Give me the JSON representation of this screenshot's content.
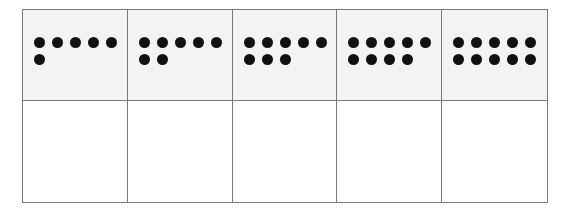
{
  "ten_frame_strip": {
    "colors": {
      "dot": "#111111",
      "top_bg": "#f3f3f3",
      "bottom_bg": "#ffffff",
      "border": "#7a7a7a"
    },
    "columns": [
      {
        "dots": 6,
        "answer": ""
      },
      {
        "dots": 7,
        "answer": ""
      },
      {
        "dots": 8,
        "answer": ""
      },
      {
        "dots": 9,
        "answer": ""
      },
      {
        "dots": 10,
        "answer": ""
      }
    ]
  }
}
